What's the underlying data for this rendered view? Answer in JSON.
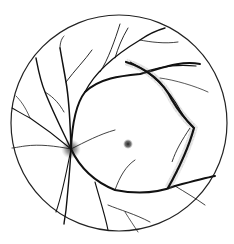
{
  "figure": {
    "type": "retinal-fundus-illustration",
    "background": "#ffffff",
    "ink": "#111111",
    "boundary": {
      "cx": 119,
      "cy": 123,
      "r": 108
    },
    "optic_disc": {
      "cx": 71,
      "cy": 149,
      "r": 9
    },
    "macula_spot": {
      "cx": 128,
      "cy": 144,
      "r": 4
    },
    "lesion": "curved-dark-band-with-halo"
  }
}
